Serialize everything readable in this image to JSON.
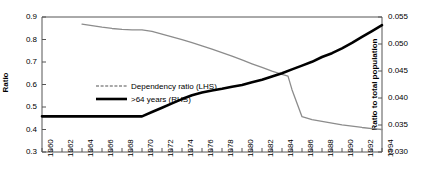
{
  "chart_data": {
    "type": "line",
    "title": "",
    "xlabel": "",
    "ylabel": "Ratio",
    "ylabel_right": "Ratio to total population",
    "xlim": [
      1960,
      1994
    ],
    "ylim": [
      0.3,
      0.9
    ],
    "ylim_right": [
      0.03,
      0.055
    ],
    "grid": false,
    "legend_position": "center-left-inside",
    "y_ticks_left": [
      "0.3",
      "0.4",
      "0.5",
      "0.6",
      "0.7",
      "0.8",
      "0.9"
    ],
    "y_ticks_right": [
      "0.030",
      "0.035",
      "0.040",
      "0.045",
      "0.050",
      "0.055"
    ],
    "x_ticks": [
      "1960",
      "1962",
      "1964",
      "1966",
      "1968",
      "1970",
      "1972",
      "1974",
      "1976",
      "1978",
      "1980",
      "1982",
      "1984",
      "1986",
      "1988",
      "1990",
      "1992",
      "1994"
    ],
    "x_minor_ticks_every": 1,
    "series": [
      {
        "name": "Dependency ratio (LHS)",
        "axis": "left",
        "color": "#8c8c8c",
        "style": "thin-gray",
        "x": [
          1964,
          1965,
          1966,
          1967,
          1968,
          1969,
          1970,
          1971,
          1972,
          1973,
          1974,
          1975,
          1976,
          1977,
          1978,
          1979,
          1980,
          1981,
          1982,
          1983,
          1984,
          1984.6,
          1985,
          1986,
          1987,
          1988,
          1989,
          1990,
          1991,
          1992,
          1993,
          1994
        ],
        "values": [
          0.868,
          0.862,
          0.855,
          0.849,
          0.845,
          0.843,
          0.843,
          0.836,
          0.824,
          0.812,
          0.799,
          0.786,
          0.772,
          0.757,
          0.742,
          0.726,
          0.709,
          0.692,
          0.676,
          0.659,
          0.645,
          0.637,
          0.577,
          0.457,
          0.444,
          0.436,
          0.428,
          0.421,
          0.415,
          0.409,
          0.404,
          0.4
        ]
      },
      {
        "name": ">64 years (RHS)",
        "axis": "right",
        "color": "#000000",
        "style": "thick-black",
        "x": [
          1960,
          1961,
          1962,
          1963,
          1964,
          1965,
          1966,
          1967,
          1968,
          1969,
          1970,
          1971,
          1972,
          1973,
          1974,
          1975,
          1976,
          1977,
          1978,
          1979,
          1980,
          1981,
          1982,
          1983,
          1984,
          1985,
          1986,
          1987,
          1988,
          1989,
          1990,
          1991,
          1992,
          1993,
          1994
        ],
        "values": [
          0.0366,
          0.0366,
          0.0366,
          0.0366,
          0.0366,
          0.0366,
          0.0366,
          0.0366,
          0.0366,
          0.0366,
          0.0366,
          0.0374,
          0.0382,
          0.039,
          0.0398,
          0.0405,
          0.041,
          0.0414,
          0.0417,
          0.0421,
          0.0424,
          0.0429,
          0.0434,
          0.044,
          0.0446,
          0.0453,
          0.046,
          0.0467,
          0.0476,
          0.0483,
          0.0492,
          0.0502,
          0.0513,
          0.0524,
          0.0535
        ]
      }
    ]
  },
  "legend": {
    "items": [
      {
        "label": "Dependency ratio (LHS)",
        "color": "#8c8c8c",
        "style": "dashed"
      },
      {
        "label": ">64 years (RHS)",
        "color": "#000000",
        "style": "solid"
      }
    ]
  }
}
